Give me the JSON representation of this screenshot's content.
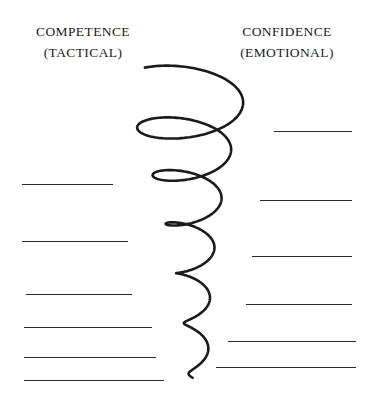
{
  "canvas": {
    "width": 368,
    "height": 394,
    "background_color": "#ffffff",
    "ink_color": "#1b1b1b",
    "rule_color": "#2a2a2e"
  },
  "headings": {
    "left": {
      "title": "COMPETENCE",
      "subtitle": "(TACTICAL)"
    },
    "right": {
      "title": "CONFIDENCE",
      "subtitle": "(EMOTIONAL)"
    }
  },
  "diagram": {
    "type": "descending-spiral",
    "name": "competence-confidence-spiral",
    "stroke_color": "#1b1b1b",
    "loop_count": 6,
    "top_y": 88,
    "bottom_y": 381,
    "widest_span_x": [
      122,
      248
    ]
  },
  "rules": {
    "left": [
      {
        "y": 184,
        "x1": 22,
        "x2": 113
      },
      {
        "y": 241,
        "x1": 22,
        "x2": 128
      },
      {
        "y": 294,
        "x1": 26,
        "x2": 132
      },
      {
        "y": 327,
        "x1": 24,
        "x2": 152
      },
      {
        "y": 357,
        "x1": 24,
        "x2": 156
      },
      {
        "y": 380,
        "x1": 24,
        "x2": 164
      }
    ],
    "right": [
      {
        "y": 131,
        "x1": 274,
        "x2": 352
      },
      {
        "y": 200,
        "x1": 260,
        "x2": 352
      },
      {
        "y": 256,
        "x1": 252,
        "x2": 352
      },
      {
        "y": 304,
        "x1": 246,
        "x2": 352
      },
      {
        "y": 341,
        "x1": 228,
        "x2": 356
      },
      {
        "y": 367,
        "x1": 216,
        "x2": 356
      }
    ]
  }
}
